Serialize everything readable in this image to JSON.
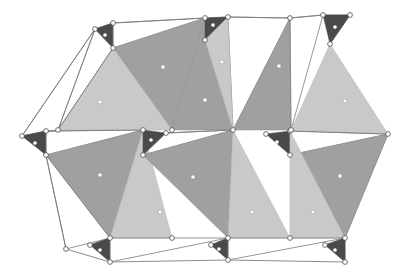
{
  "figure": {
    "kind": "polyhedral-tetrahedral-sheet-diagram",
    "background_color": "#ffffff",
    "palette": {
      "dark_face": "#4a4a4a",
      "mid_gray_face": "#a0a0a0",
      "light_gray_face": "#c9c9c9",
      "open_face": "#ffffff",
      "edge_stroke": "#6e6e6e",
      "vertex_fill": "#fdfdfd",
      "vertex_stroke": "#3a3a3a",
      "center_dot_fill": "#ffffff"
    },
    "legend_note": "",
    "counts": {
      "dark_faces": "10",
      "mid_gray_faces": "6",
      "light_gray_faces": "6",
      "open_faces": "8",
      "vertices": "24"
    },
    "faces": [
      {
        "id": "d-top-1",
        "tone": "dark",
        "points": "95,29 113,23 113,48",
        "dot": "105,35"
      },
      {
        "id": "o-top-1",
        "tone": "open",
        "points": "113,23 205,18 113,48",
        "dot": ""
      },
      {
        "id": "m-top-1",
        "tone": "mid",
        "points": "113,48 205,18 172,130",
        "dot": "163,67"
      },
      {
        "id": "l-top-1",
        "tone": "light",
        "points": "113,48 172,130 58,130",
        "dot": "100,102"
      },
      {
        "id": "o-left-1",
        "tone": "open",
        "points": "95,29 113,48 58,130",
        "dot": ""
      },
      {
        "id": "o-left-2",
        "tone": "open",
        "points": "95,29 58,130 22,136",
        "dot": ""
      },
      {
        "id": "m-top-2",
        "tone": "mid",
        "points": "205,18 233,130 172,130",
        "dot": "205,100"
      },
      {
        "id": "d-top-2",
        "tone": "dark",
        "points": "205,18 228,17 205,40",
        "dot": "213,25"
      },
      {
        "id": "o-top-2",
        "tone": "open",
        "points": "228,17 290,18 233,130",
        "dot": ""
      },
      {
        "id": "l-top-2",
        "tone": "light",
        "points": "205,40 233,130 228,17",
        "dot": "222,62"
      },
      {
        "id": "m-top-3",
        "tone": "mid",
        "points": "290,18 291,130 233,130",
        "dot": "279,66"
      },
      {
        "id": "d-top-3",
        "tone": "dark",
        "points": "323,15 350,15 330,44",
        "dot": "335,27"
      },
      {
        "id": "o-top-3",
        "tone": "open",
        "points": "290,18 323,15 291,130",
        "dot": ""
      },
      {
        "id": "l-top-3",
        "tone": "light",
        "points": "330,44 388,134 291,130",
        "dot": "345,101"
      },
      {
        "id": "d-mid-l",
        "tone": "dark",
        "points": "22,136 46,131 46,155",
        "dot": "35,143"
      },
      {
        "id": "o-mid-1",
        "tone": "open",
        "points": "46,131 143,130 46,155",
        "dot": ""
      },
      {
        "id": "m-bot-1",
        "tone": "mid",
        "points": "46,155 143,130 110,238",
        "dot": "100,175"
      },
      {
        "id": "l-bot-1",
        "tone": "light",
        "points": "110,238 143,130 172,238",
        "dot": "160,212"
      },
      {
        "id": "o-bot-1",
        "tone": "open",
        "points": "46,155 110,238 66,249",
        "dot": ""
      },
      {
        "id": "d-mid-c",
        "tone": "dark",
        "points": "143,130 166,133 143,155",
        "dot": "151,140"
      },
      {
        "id": "o-mid-2",
        "tone": "open",
        "points": "166,133 233,130 143,155",
        "dot": ""
      },
      {
        "id": "m-bot-2",
        "tone": "mid",
        "points": "143,155 233,130 228,238",
        "dot": "193,177"
      },
      {
        "id": "l-bot-2",
        "tone": "light",
        "points": "228,238 233,130 290,238",
        "dot": "252,212"
      },
      {
        "id": "d-mid-r",
        "tone": "dark",
        "points": "266,134 290,131 290,155",
        "dot": "277,142"
      },
      {
        "id": "o-mid-3",
        "tone": "open",
        "points": "290,131 388,134 290,155",
        "dot": ""
      },
      {
        "id": "m-bot-3",
        "tone": "mid",
        "points": "290,155 388,134 345,238",
        "dot": "340,176"
      },
      {
        "id": "l-bot-3",
        "tone": "light",
        "points": "290,238 290,131 345,238",
        "dot": "313,212"
      },
      {
        "id": "d-bot-1",
        "tone": "dark",
        "points": "90,245 110,238 110,262",
        "dot": "100,250"
      },
      {
        "id": "o-bot-2",
        "tone": "open",
        "points": "110,238 228,238 110,262",
        "dot": ""
      },
      {
        "id": "d-bot-2",
        "tone": "dark",
        "points": "211,245 228,238 228,260",
        "dot": "219,249"
      },
      {
        "id": "o-bot-3",
        "tone": "open",
        "points": "228,238 345,238 228,260",
        "dot": ""
      },
      {
        "id": "d-bot-3",
        "tone": "dark",
        "points": "325,245 345,238 345,262",
        "dot": "335,250"
      }
    ],
    "vertices": [
      "95,29",
      "113,23",
      "113,48",
      "205,18",
      "228,17",
      "205,40",
      "290,18",
      "323,15",
      "350,15",
      "330,44",
      "22,136",
      "46,131",
      "46,155",
      "143,130",
      "166,133",
      "143,155",
      "233,130",
      "266,134",
      "290,131",
      "290,155",
      "388,134",
      "172,130",
      "291,130",
      "58,130",
      "110,238",
      "228,238",
      "345,238",
      "90,245",
      "211,245",
      "325,245",
      "110,262",
      "228,260",
      "345,262",
      "66,249",
      "172,238",
      "290,238"
    ],
    "edges": [
      "95,29 113,23",
      "113,23 205,18",
      "95,29 22,136",
      "22,136 46,131",
      "58,130 113,48",
      "205,18 228,17",
      "228,17 290,18",
      "290,18 323,15",
      "323,15 350,15",
      "350,15 330,44",
      "46,155 66,249",
      "66,249 110,262",
      "110,262 228,260",
      "228,260 345,262",
      "90,245 110,238",
      "211,245 228,238",
      "325,245 345,238",
      "345,238 345,262",
      "46,131 143,130",
      "166,133 233,130",
      "290,131 388,134",
      "388,134 345,238"
    ]
  }
}
